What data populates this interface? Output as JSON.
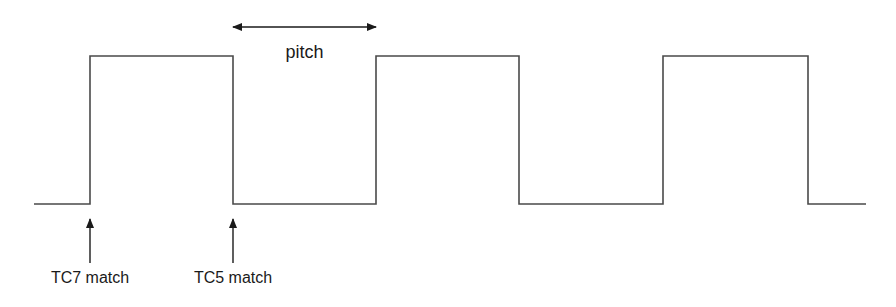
{
  "diagram": {
    "type": "timing-waveform",
    "pitch_label": "pitch",
    "markers": [
      {
        "label": "TC7 match",
        "x": 90
      },
      {
        "label": "TC5 match",
        "x": 233
      }
    ],
    "waveform": {
      "low_y": 204,
      "high_y": 56,
      "start_x": 34,
      "end_x": 866,
      "edges": [
        90,
        233,
        376,
        519,
        663,
        808
      ],
      "initial_level": "low"
    },
    "pitch_arrow": {
      "x1": 233,
      "x2": 376,
      "y": 27
    },
    "colors": {
      "line": "#4a4a4a",
      "text": "#1a1a1a",
      "background": "#ffffff"
    }
  }
}
